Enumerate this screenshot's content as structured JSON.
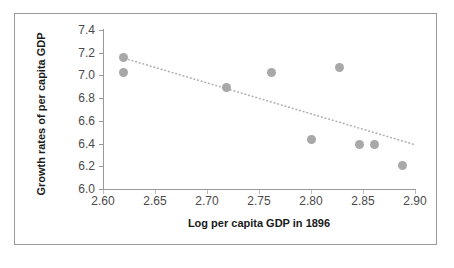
{
  "chart_data": {
    "type": "scatter",
    "title": "",
    "xlabel": "Log per capita GDP in 1896",
    "ylabel": "Growth rates of per capita GDP",
    "xlim": [
      2.6,
      2.9
    ],
    "ylim": [
      6.0,
      7.4
    ],
    "xticks": [
      "2.60",
      "2.65",
      "2.70",
      "2.75",
      "2.80",
      "2.85",
      "2.90"
    ],
    "yticks": [
      "7.4",
      "7.2",
      "7.0",
      "6.8",
      "6.6",
      "6.4",
      "6.2",
      "6.0"
    ],
    "grid": false,
    "legend": null,
    "point_color": "#a8a8a8",
    "trend_color": "#b0b0b0",
    "axis_color": "#9a9a9a",
    "points": [
      {
        "x": 2.62,
        "y": 7.16
      },
      {
        "x": 2.62,
        "y": 7.03
      },
      {
        "x": 2.719,
        "y": 6.89
      },
      {
        "x": 2.762,
        "y": 7.03
      },
      {
        "x": 2.8,
        "y": 6.44
      },
      {
        "x": 2.827,
        "y": 7.07
      },
      {
        "x": 2.847,
        "y": 6.39
      },
      {
        "x": 2.861,
        "y": 6.39
      },
      {
        "x": 2.888,
        "y": 6.21
      }
    ],
    "series": [
      {
        "name": "Growth rates of per capita GDP",
        "x": [
          2.62,
          2.62,
          2.719,
          2.762,
          2.8,
          2.827,
          2.847,
          2.861,
          2.888
        ],
        "values": [
          7.16,
          7.03,
          6.89,
          7.03,
          6.44,
          7.07,
          6.39,
          6.39,
          6.21
        ]
      }
    ],
    "trendline": {
      "style": "dotted",
      "x_start": 2.621,
      "y_start": 7.15,
      "x_end": 2.9,
      "y_end": 6.39
    }
  }
}
